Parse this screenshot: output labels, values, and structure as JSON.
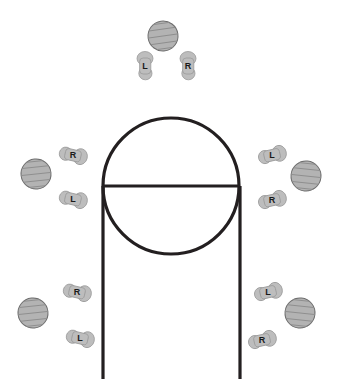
{
  "diagram": {
    "type": "court-diagram",
    "canvas": {
      "width": 338,
      "height": 379,
      "background": "#ffffff"
    },
    "colors": {
      "line": "#231f20",
      "ball_fill": "#b3b3b3",
      "ball_stroke": "#6e6e6e",
      "foot_fill": "#bdbdbd",
      "foot_stroke": "#9a9a9a",
      "label_text": "#1a1a1a"
    },
    "court": {
      "free_throw_circle": {
        "cx": 171,
        "cy": 186,
        "r": 68,
        "stroke_width": 3.2
      },
      "free_throw_line": {
        "x1": 103,
        "y1": 186,
        "x2": 240,
        "y2": 186,
        "stroke_width": 3.2
      },
      "lane_line_left": {
        "x1": 103,
        "y1": 186,
        "x2": 103,
        "y2": 379,
        "stroke_width": 3.2
      },
      "lane_line_right": {
        "x1": 240,
        "y1": 186,
        "x2": 240,
        "y2": 379,
        "stroke_width": 3.2
      }
    },
    "spots": [
      {
        "id": "spot-top-center",
        "name": "top-of-key",
        "ball": {
          "cx": 163,
          "cy": 36,
          "rx": 15,
          "ry": 15,
          "rotate": -8
        },
        "feet": [
          {
            "label": "L",
            "cx": 145,
            "cy": 66,
            "rotate": 0
          },
          {
            "label": "R",
            "cx": 188,
            "cy": 66,
            "rotate": 0
          }
        ]
      },
      {
        "id": "spot-left-wing",
        "name": "left-wing",
        "ball": {
          "cx": 36,
          "cy": 174,
          "rx": 15,
          "ry": 15,
          "rotate": -6
        },
        "feet": [
          {
            "label": "R",
            "cx": 73,
            "cy": 155,
            "rotate": 103
          },
          {
            "label": "L",
            "cx": 73,
            "cy": 199,
            "rotate": 103
          }
        ]
      },
      {
        "id": "spot-right-wing",
        "name": "right-wing",
        "ball": {
          "cx": 306,
          "cy": 176,
          "rx": 15,
          "ry": 15,
          "rotate": 6
        },
        "feet": [
          {
            "label": "L",
            "cx": 272,
            "cy": 155,
            "rotate": 77
          },
          {
            "label": "R",
            "cx": 272,
            "cy": 200,
            "rotate": 77
          }
        ]
      },
      {
        "id": "spot-left-baseline",
        "name": "left-baseline",
        "ball": {
          "cx": 33,
          "cy": 313,
          "rx": 15,
          "ry": 15,
          "rotate": -6
        },
        "feet": [
          {
            "label": "R",
            "cx": 77,
            "cy": 292,
            "rotate": 103
          },
          {
            "label": "L",
            "cx": 80,
            "cy": 338,
            "rotate": 103
          }
        ]
      },
      {
        "id": "spot-right-baseline",
        "name": "right-baseline",
        "ball": {
          "cx": 300,
          "cy": 313,
          "rx": 15,
          "ry": 15,
          "rotate": 6
        },
        "feet": [
          {
            "label": "L",
            "cx": 268,
            "cy": 292,
            "rotate": 77
          },
          {
            "label": "R",
            "cx": 262,
            "cy": 340,
            "rotate": 77
          }
        ]
      }
    ]
  }
}
